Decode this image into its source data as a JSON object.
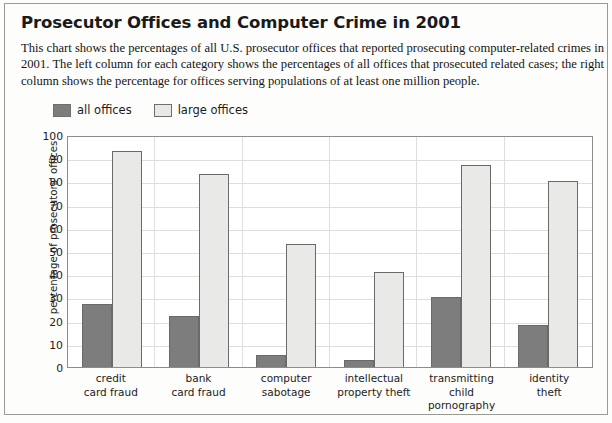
{
  "header": {
    "title": "Prosecutor Offices and Computer Crime in 2001",
    "description": "This chart shows the percentages of all U.S. prosecutor offices that reported prosecuting computer-related crimes in 2001. The left column for each category shows the percentages of all offices that prosecuted related cases; the right column shows the percentage for offices serving populations of at least one million people."
  },
  "legend": {
    "items": [
      {
        "label": "all offices",
        "color": "#7d7d7d",
        "swatch": "dark"
      },
      {
        "label": "large offices",
        "color": "#e8e8e6",
        "swatch": "light"
      }
    ]
  },
  "chart_data": {
    "type": "bar",
    "title": "Prosecutor Offices and Computer Crime in 2001",
    "xlabel": "",
    "ylabel": "percentage of prosecutors' offices",
    "ylim": [
      0,
      100
    ],
    "ytick_step": 10,
    "yticks": [
      0,
      10,
      20,
      30,
      40,
      50,
      60,
      70,
      80,
      90,
      100
    ],
    "grid": true,
    "legend_position": "above-plot-left",
    "categories": [
      "credit card fraud",
      "bank card fraud",
      "computer sabotage",
      "intellectual property theft",
      "transmitting child pornography",
      "identity theft"
    ],
    "series": [
      {
        "name": "all offices",
        "color": "#7d7d7d",
        "values": [
          27,
          22,
          5,
          3,
          30,
          18
        ]
      },
      {
        "name": "large offices",
        "color": "#e9e9e7",
        "values": [
          93,
          83,
          53,
          41,
          87,
          80
        ]
      }
    ]
  }
}
